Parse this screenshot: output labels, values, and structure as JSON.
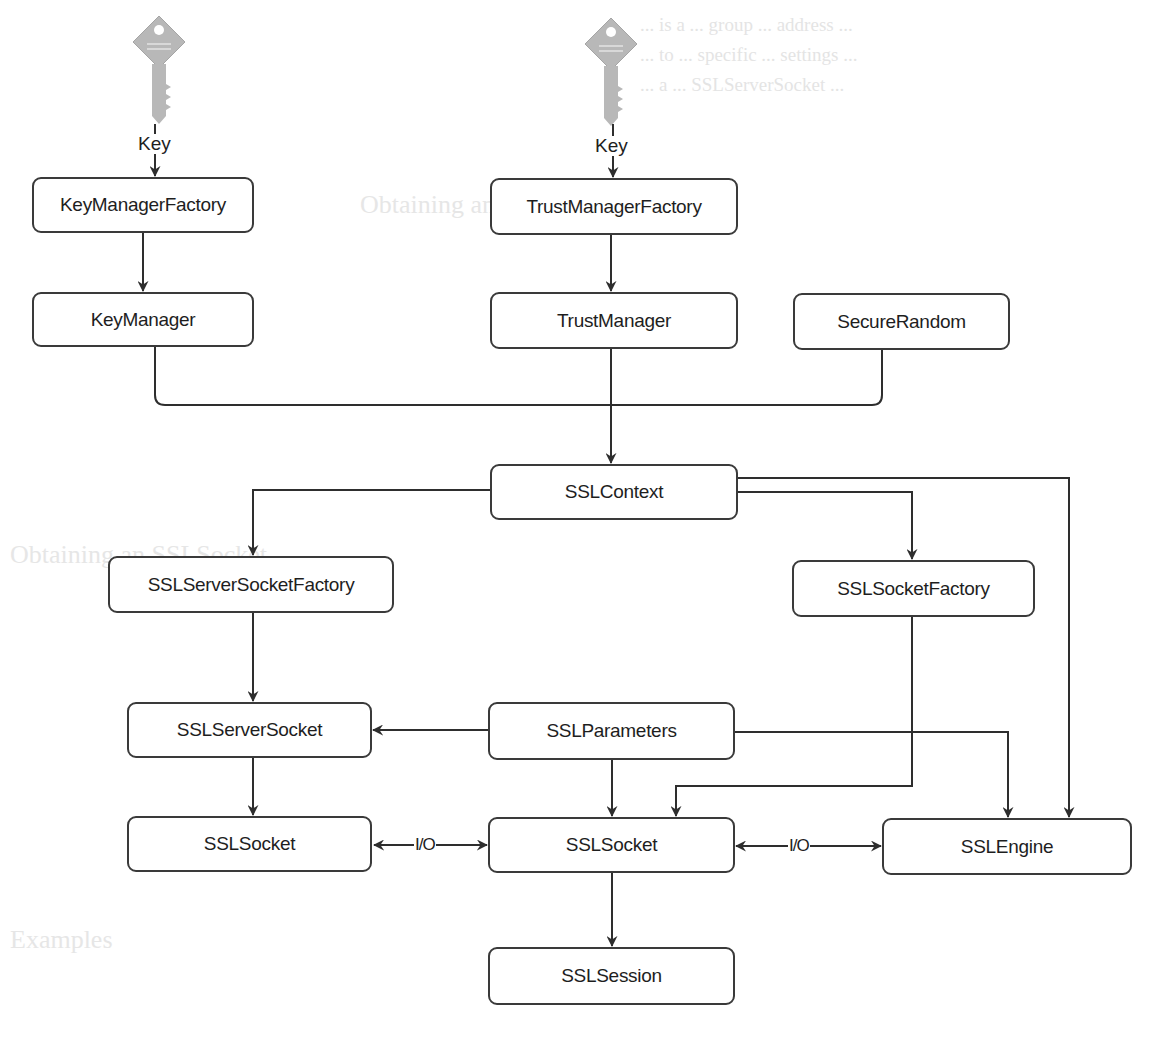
{
  "diagram": {
    "key_icons": [
      {
        "id": "key-left",
        "label": "Key"
      },
      {
        "id": "key-center",
        "label": "Key"
      }
    ],
    "nodes": {
      "key_manager_factory": "KeyManagerFactory",
      "trust_manager_factory": "TrustManagerFactory",
      "key_manager": "KeyManager",
      "trust_manager": "TrustManager",
      "secure_random": "SecureRandom",
      "ssl_context": "SSLContext",
      "ssl_server_socket_factory": "SSLServerSocketFactory",
      "ssl_socket_factory": "SSLSocketFactory",
      "ssl_server_socket": "SSLServerSocket",
      "ssl_parameters": "SSLParameters",
      "ssl_socket_left": "SSLSocket",
      "ssl_socket_center": "SSLSocket",
      "ssl_engine": "SSLEngine",
      "ssl_session": "SSLSession"
    },
    "edge_labels": {
      "io_left": "I/O",
      "io_right": "I/O"
    },
    "edges": [
      {
        "from": "Key",
        "to": "KeyManagerFactory"
      },
      {
        "from": "Key",
        "to": "TrustManagerFactory"
      },
      {
        "from": "KeyManagerFactory",
        "to": "KeyManager"
      },
      {
        "from": "TrustManagerFactory",
        "to": "TrustManager"
      },
      {
        "from": "KeyManager",
        "to": "SSLContext"
      },
      {
        "from": "TrustManager",
        "to": "SSLContext"
      },
      {
        "from": "SecureRandom",
        "to": "SSLContext"
      },
      {
        "from": "SSLContext",
        "to": "SSLServerSocketFactory"
      },
      {
        "from": "SSLContext",
        "to": "SSLSocketFactory"
      },
      {
        "from": "SSLContext",
        "to": "SSLEngine"
      },
      {
        "from": "SSLServerSocketFactory",
        "to": "SSLServerSocket"
      },
      {
        "from": "SSLSocketFactory",
        "to": "SSLSocket"
      },
      {
        "from": "SSLParameters",
        "to": "SSLServerSocket"
      },
      {
        "from": "SSLParameters",
        "to": "SSLSocket"
      },
      {
        "from": "SSLParameters",
        "to": "SSLEngine"
      },
      {
        "from": "SSLServerSocket",
        "to": "SSLSocket"
      },
      {
        "from": "SSLSocket",
        "to": "SSLSocket",
        "label": "I/O",
        "bidirectional": true
      },
      {
        "from": "SSLSocket",
        "to": "SSLEngine",
        "label": "I/O",
        "bidirectional": true
      },
      {
        "from": "SSLSocket",
        "to": "SSLSession"
      }
    ],
    "colors": {
      "stroke": "#2e2e2e",
      "key_fill": "#b5b5b5",
      "background": "#ffffff"
    }
  },
  "background_text": {
    "line1": "... is a ... group ... address ...",
    "line2": "... to ... specific ... settings ...",
    "line3": "... a ... SSLServerSocket ...",
    "heading1": "Obtaining an SSLSocketFactory",
    "heading2": "Obtaining an SSLSocket",
    "heading3": "Examples"
  }
}
